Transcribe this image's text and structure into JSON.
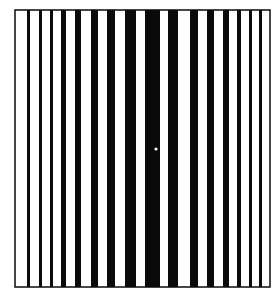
{
  "figure": {
    "kind": "optical-illusion-stripe-grating",
    "background_color": "#ffffff",
    "ink_color": "#0a0a0a",
    "frame": {
      "left": 15,
      "top": 10,
      "right": 270,
      "bottom": 287,
      "stroke": 1.5
    },
    "center_dot": {
      "x": 156,
      "y": 149,
      "r": 1.6,
      "color": "#ffffff"
    },
    "stripes": [
      {
        "x0": 27,
        "x1": 30
      },
      {
        "x0": 39,
        "x1": 42
      },
      {
        "x0": 50,
        "x1": 53
      },
      {
        "x0": 61,
        "x1": 66
      },
      {
        "x0": 75,
        "x1": 81
      },
      {
        "x0": 91,
        "x1": 98
      },
      {
        "x0": 107,
        "x1": 115
      },
      {
        "x0": 125,
        "x1": 136
      },
      {
        "x0": 145,
        "x1": 160
      },
      {
        "x0": 168,
        "x1": 178
      },
      {
        "x0": 190,
        "x1": 198
      },
      {
        "x0": 207,
        "x1": 214
      },
      {
        "x0": 223,
        "x1": 229
      },
      {
        "x0": 237,
        "x1": 241
      },
      {
        "x0": 249,
        "x1": 252
      },
      {
        "x0": 259,
        "x1": 262
      }
    ]
  }
}
